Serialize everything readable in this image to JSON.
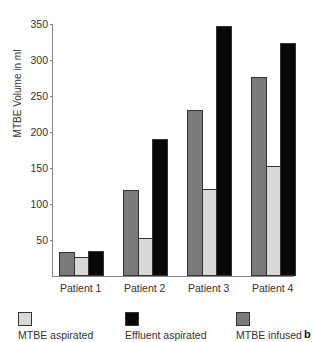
{
  "chart_data": {
    "type": "bar",
    "title": "",
    "xlabel": "",
    "ylabel": "MTBE Volume in ml",
    "ylim": [
      0,
      350
    ],
    "yticks": [
      50,
      100,
      150,
      200,
      250,
      300,
      350
    ],
    "grid": false,
    "legend_position": "bottom",
    "categories": [
      "Patient 1",
      "Patient 2",
      "Patient 3",
      "Patient 4"
    ],
    "series": [
      {
        "name": "MTBE infused",
        "color": "#7a7a7a",
        "values": [
          33,
          119,
          230,
          277
        ]
      },
      {
        "name": "MTBE aspirated",
        "color": "#d8d8d8",
        "values": [
          26,
          53,
          121,
          153
        ]
      },
      {
        "name": "Effluent aspirated",
        "color": "#080808",
        "values": [
          35,
          190,
          347,
          323
        ]
      }
    ],
    "panel_label": "b"
  },
  "legend": [
    {
      "label": "MTBE aspirated",
      "color": "#d8d8d8"
    },
    {
      "label": "Effluent aspirated",
      "color": "#080808"
    },
    {
      "label": "MTBE infused",
      "color": "#7a7a7a"
    }
  ]
}
